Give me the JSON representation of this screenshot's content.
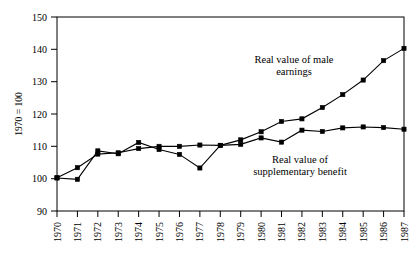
{
  "chart_data": {
    "type": "line",
    "title": "",
    "subtitle": "",
    "xlabel": "",
    "ylabel": "1970 = 100",
    "ylim": [
      90,
      150
    ],
    "xlim": [
      1970,
      1987
    ],
    "grid": false,
    "legend_position": "inline-annotations",
    "x": [
      1970,
      1971,
      1972,
      1973,
      1974,
      1975,
      1976,
      1977,
      1978,
      1979,
      1980,
      1981,
      1982,
      1983,
      1984,
      1985,
      1986,
      1987
    ],
    "categories": [
      "1970",
      "1971",
      "1972",
      "1973",
      "1974",
      "1975",
      "1976",
      "1977",
      "1978",
      "1979",
      "1980",
      "1981",
      "1982",
      "1983",
      "1984",
      "1985",
      "1986",
      "1987"
    ],
    "ytick_labels": [
      "150",
      "140",
      "130",
      "120",
      "110",
      "100"
    ],
    "ytick_values": [
      150,
      140,
      130,
      120,
      110,
      100
    ],
    "series": [
      {
        "name": "Real value of male earnings",
        "annotation": "Real value of male\nearnings",
        "annotation_line1": "Real value of male",
        "annotation_line2": "earnings",
        "values": [
          100.3,
          103.4,
          107.6,
          108.0,
          109.3,
          110.0,
          110.0,
          110.4,
          110.3,
          112.0,
          114.5,
          117.7,
          118.5,
          122.0,
          126.0,
          130.5,
          136.5,
          140.3
        ]
      },
      {
        "name": "Real value of supplementary benefit",
        "annotation": "Real value of\nsupplementary benefit",
        "annotation_line1": "Real value of",
        "annotation_line2": "supplementary benefit",
        "values": [
          100.2,
          99.8,
          108.6,
          107.7,
          111.2,
          109.0,
          107.5,
          103.3,
          110.3,
          110.6,
          112.6,
          111.3,
          115.0,
          114.6,
          115.7,
          116.0,
          115.8,
          115.3
        ]
      }
    ]
  },
  "annotations": {
    "male_earnings_label_line1": "Real value of male",
    "male_earnings_label_line2": "earnings",
    "supplementary_benefit_label_line1": "Real value of",
    "supplementary_benefit_label_line2": "supplementary benefit"
  },
  "axis": {
    "y_title": "1970 = 100",
    "y_bottom_label": "90"
  },
  "colors": {
    "ink": "#000000",
    "background": "#ffffff"
  }
}
